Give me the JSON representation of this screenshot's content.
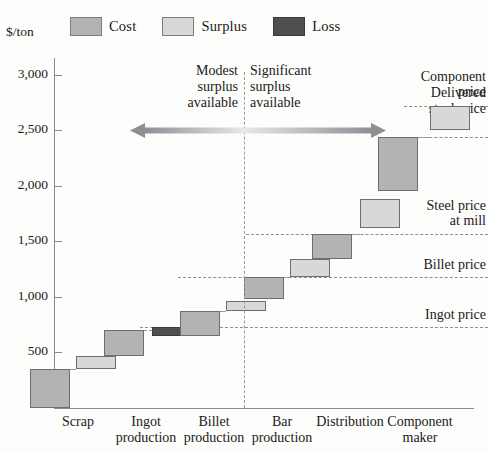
{
  "axis": {
    "unit_label": "$/ton",
    "y_ticks": [
      "500",
      "1,000",
      "1,500",
      "2,000",
      "2,500",
      "3,000"
    ],
    "y_tick_values": [
      500,
      1000,
      1500,
      2000,
      2500,
      3000
    ]
  },
  "legend": {
    "items": [
      {
        "label": "Cost",
        "color": "#b3b3b3",
        "key": "cost"
      },
      {
        "label": "Surplus",
        "color": "#d8d8d8",
        "key": "surplus"
      },
      {
        "label": "Loss",
        "color": "#4f4f4f",
        "key": "loss"
      }
    ]
  },
  "zones": {
    "left_note": "Modest\nsurplus\navailable",
    "left_line1": "Modest",
    "left_line2": "surplus",
    "left_line3": "available",
    "right_line1": "Significant",
    "right_line2": "surplus",
    "right_line3": "available"
  },
  "reference_lines": [
    {
      "label_line1": "Component",
      "label_line2": "price",
      "value": 2720
    },
    {
      "label_line1": "Delivered",
      "label_line2": "steel price",
      "value": 2440
    },
    {
      "label_line1": "Steel price",
      "label_line2": "at mill",
      "value": 1570
    },
    {
      "label_line1": "Billet price",
      "label_line2": "",
      "value": 1180
    },
    {
      "label_line1": "Ingot price",
      "label_line2": "",
      "value": 730
    }
  ],
  "chart_data": {
    "type": "bar",
    "title": "",
    "subtitle": "",
    "xlabel": "",
    "ylabel": "$/ton",
    "ylim": [
      0,
      3150
    ],
    "grid": false,
    "legend_position": "top-left",
    "categories": [
      "Scrap",
      "Ingot production",
      "Billet production",
      "Bar production",
      "Distribution",
      "Component maker"
    ],
    "category_lines": [
      [
        "Scrap",
        ""
      ],
      [
        "Ingot",
        "production"
      ],
      [
        "Billet",
        "production"
      ],
      [
        "Bar",
        "production"
      ],
      [
        "Distribution",
        ""
      ],
      [
        "Component",
        "maker"
      ]
    ],
    "segments": [
      {
        "category": "Scrap",
        "kind": "cost",
        "label": "Cost",
        "bottom": 0,
        "top": 350
      },
      {
        "category": "Scrap",
        "kind": "surplus",
        "label": "Surplus",
        "bottom": 350,
        "top": 470
      },
      {
        "category": "Ingot production",
        "kind": "cost",
        "label": "Cost",
        "bottom": 470,
        "top": 700
      },
      {
        "category": "Ingot production",
        "kind": "loss",
        "label": "Loss",
        "bottom": 650,
        "top": 730
      },
      {
        "category": "Billet production",
        "kind": "cost",
        "label": "Cost",
        "bottom": 650,
        "top": 870
      },
      {
        "category": "Billet production",
        "kind": "surplus",
        "label": "Surplus",
        "bottom": 870,
        "top": 960
      },
      {
        "category": "Bar production",
        "kind": "cost",
        "label": "Cost",
        "bottom": 980,
        "top": 1180
      },
      {
        "category": "Bar production",
        "kind": "surplus",
        "label": "Surplus",
        "bottom": 1180,
        "top": 1340
      },
      {
        "category": "Distribution",
        "kind": "cost",
        "label": "Cost",
        "bottom": 1340,
        "top": 1570
      },
      {
        "category": "Distribution",
        "kind": "surplus",
        "label": "Surplus",
        "bottom": 1620,
        "top": 1880
      },
      {
        "category": "Component maker",
        "kind": "cost",
        "label": "Cost",
        "bottom": 1950,
        "top": 2440
      },
      {
        "category": "Component maker",
        "kind": "surplus",
        "label": "Surplus",
        "bottom": 2500,
        "top": 2720
      }
    ],
    "annotations": [
      "Modest surplus available",
      "Significant surplus available",
      "Component price",
      "Delivered steel price",
      "Steel price at mill",
      "Billet price",
      "Ingot price"
    ]
  }
}
